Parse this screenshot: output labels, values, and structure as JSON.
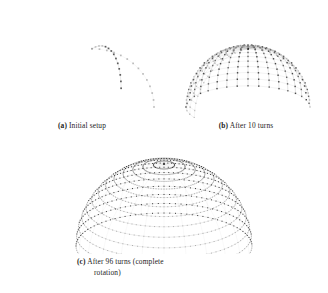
{
  "figure": {
    "kind": "latex-subfigure-group",
    "background_color": "#ffffff",
    "ink_color": "#1c1c1c",
    "subfigures": [
      {
        "id": "a",
        "tag": "(a)",
        "caption": "Initial setup",
        "caption_full": "(a) Initial setup",
        "render": {
          "type": "arc-points",
          "arc_count": 2,
          "points_per_arc": 14,
          "marker": "square-dot",
          "width": 156,
          "height": 112,
          "center_x": 88,
          "center_y": 101,
          "radius": 62,
          "arc_rotations_deg": [
            0,
            62
          ],
          "tilt_deg": 20,
          "connect_points": true,
          "line_color": "#c9c9c9",
          "point_color": "#2b2b2b",
          "point_size": 1.7
        }
      },
      {
        "id": "b",
        "tag": "(b)",
        "caption": "After 10 turns",
        "caption_full": "(b) After 10 turns",
        "render": {
          "type": "arc-points",
          "arc_count": 22,
          "points_per_arc": 14,
          "marker": "square-dot",
          "width": 156,
          "height": 112,
          "center_x": 80,
          "center_y": 101,
          "radius": 62,
          "arc_rotations_deg": [
            0,
            10,
            20,
            30,
            40,
            50,
            60,
            70,
            80,
            90,
            100,
            110,
            120,
            130,
            140,
            150,
            160,
            170,
            180,
            190,
            200,
            210
          ],
          "tilt_deg": 20,
          "connect_points": true,
          "line_color": "#b8b8b8",
          "point_color": "#2b2b2b",
          "point_size": 1.4
        }
      },
      {
        "id": "c",
        "tag": "(c)",
        "caption": "After 96 turns (complete rotation)",
        "caption_line1": "After  96  turns  (complete",
        "caption_line2": "rotation)",
        "caption_full": "(c) After 96 turns (complete rotation)",
        "render": {
          "type": "dome-points",
          "arc_count": 96,
          "points_per_arc": 14,
          "marker": "square-dot",
          "width": 216,
          "height": 108,
          "center_x": 108,
          "center_y": 100,
          "radius": 88,
          "tilt_deg": 22,
          "connect_rings": true,
          "ring_color": "#9a9a9a",
          "point_color": "#262626",
          "point_size": 1.0
        }
      }
    ]
  },
  "chart_data": {
    "type": "scatter",
    "title": "",
    "panels": [
      {
        "label": "(a) Initial setup",
        "turns": 0,
        "arcs_drawn": 2,
        "points_per_arc": 14,
        "total_points": 28
      },
      {
        "label": "(b) After 10 turns",
        "turns": 10,
        "arcs_drawn": 22,
        "points_per_arc": 14,
        "total_points": 308
      },
      {
        "label": "(c) After 96 turns (complete rotation)",
        "turns": 96,
        "arcs_drawn": 96,
        "points_per_arc": 14,
        "total_points": 1344
      }
    ],
    "xlabel": "",
    "ylabel": "",
    "legend": []
  }
}
